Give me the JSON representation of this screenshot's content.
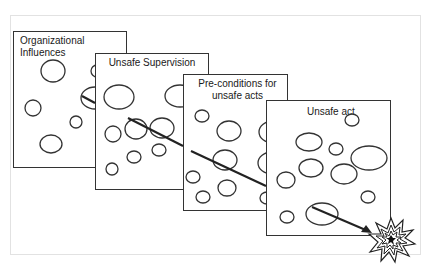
{
  "diagram": {
    "type": "swiss-cheese-model",
    "slices": [
      {
        "id": "organizational-influences",
        "label": "Organizational Influences",
        "x": 13,
        "y": 31,
        "w": 114,
        "h": 137
      },
      {
        "id": "unsafe-supervision",
        "label": "Unsafe Supervision",
        "x": 95,
        "y": 53,
        "w": 114,
        "h": 137
      },
      {
        "id": "preconditions",
        "label": "Pre-conditions for unsafe acts",
        "x": 183,
        "y": 74,
        "w": 105,
        "h": 137
      },
      {
        "id": "unsafe-act",
        "label": "Unsafe act",
        "x": 266,
        "y": 100,
        "w": 125,
        "h": 136
      }
    ],
    "trajectory": {
      "from": [
        80,
        95
      ],
      "to": [
        370,
        232
      ],
      "label": "accident trajectory"
    },
    "outcome": {
      "label": "accident",
      "x": 392,
      "y": 240
    },
    "colors": {
      "stroke": "#333333",
      "frame": "#e2e2e2",
      "background": "#ffffff"
    }
  }
}
